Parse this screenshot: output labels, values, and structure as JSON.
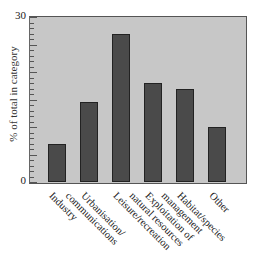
{
  "chart_data": {
    "type": "bar",
    "title": "",
    "xlabel": "",
    "ylabel": "% of total in category",
    "categories": [
      "Industry",
      "Urbanisation/ communications",
      "Leisure/recreation",
      "Exploitation of natural resources",
      "Habitat/species management",
      "Other"
    ],
    "category_lines": [
      [
        "Industry"
      ],
      [
        "Urbanisation/",
        "communications"
      ],
      [
        "Leisure/recreation"
      ],
      [
        "Exploitation of",
        "natural resources"
      ],
      [
        "Habitat/species",
        "management"
      ],
      [
        "Other"
      ]
    ],
    "values": [
      7,
      14.5,
      27,
      18,
      17,
      10
    ],
    "ylim": [
      0,
      30
    ],
    "yticks_labeled": [
      "0",
      "30"
    ],
    "minor_tick_step": 1,
    "major_tick_step": 5,
    "grid": false,
    "legend": null,
    "colors": {
      "bar": "#4a4a4a",
      "plot_background": "#c7c7c7",
      "axis": "#555555"
    }
  }
}
